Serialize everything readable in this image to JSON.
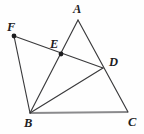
{
  "figure": {
    "background_color": "#fefefe",
    "stroke_color": "#3a3a3c",
    "base_stroke_color": "#8b8b8d",
    "label_color": "#1d1d1f",
    "width": 144,
    "height": 134
  },
  "chart_data": {
    "type": "diagram",
    "coordinate_space": {
      "width": 144,
      "height": 134,
      "origin": "top-left"
    },
    "points": [
      {
        "id": "A",
        "label": "A",
        "x": 78,
        "y": 20,
        "dot": false,
        "label_x": 73,
        "label_y": 3
      },
      {
        "id": "B",
        "label": "B",
        "x": 30,
        "y": 113,
        "dot": false,
        "label_x": 24,
        "label_y": 117
      },
      {
        "id": "C",
        "label": "C",
        "x": 128,
        "y": 112,
        "dot": false,
        "label_x": 128,
        "label_y": 116
      },
      {
        "id": "D",
        "label": "D",
        "x": 103,
        "y": 68,
        "dot": false,
        "label_x": 109,
        "label_y": 56
      },
      {
        "id": "E",
        "label": "E",
        "x": 61,
        "y": 54,
        "dot": true,
        "label_x": 50,
        "label_y": 38
      },
      {
        "id": "F",
        "label": "F",
        "x": 14,
        "y": 36,
        "dot": true,
        "label_x": 7,
        "label_y": 21
      }
    ],
    "segments": [
      {
        "name": "A-C",
        "from": "A",
        "to": "C",
        "style": "normal",
        "note": "passes through D"
      },
      {
        "name": "F-D",
        "from": "F",
        "to": "D",
        "style": "normal",
        "note": "passes through E"
      },
      {
        "name": "B-A",
        "from": "B",
        "to": "A",
        "style": "normal",
        "note": "passes through E"
      },
      {
        "name": "B-D",
        "from": "B",
        "to": "D",
        "style": "normal"
      },
      {
        "name": "B-F",
        "from": "B",
        "to": "F",
        "style": "normal"
      },
      {
        "name": "B-C",
        "from": "B",
        "to": "C",
        "style": "base"
      }
    ],
    "marked_points": [
      "E",
      "F"
    ],
    "dot_radius": 2.4
  }
}
